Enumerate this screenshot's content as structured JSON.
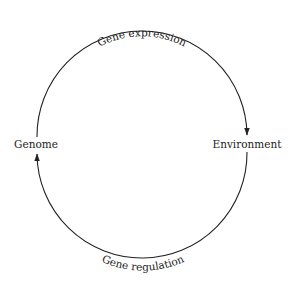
{
  "diagram": {
    "nodes": {
      "left": "Genome",
      "right": "Environment"
    },
    "arcs": {
      "top": {
        "label": "Gene expression",
        "from": "Genome",
        "to": "Environment"
      },
      "bottom": {
        "label": "Gene regulation",
        "from": "Environment",
        "to": "Genome"
      }
    },
    "colors": {
      "stroke": "#222222",
      "text": "#222222",
      "background": "#ffffff"
    }
  }
}
